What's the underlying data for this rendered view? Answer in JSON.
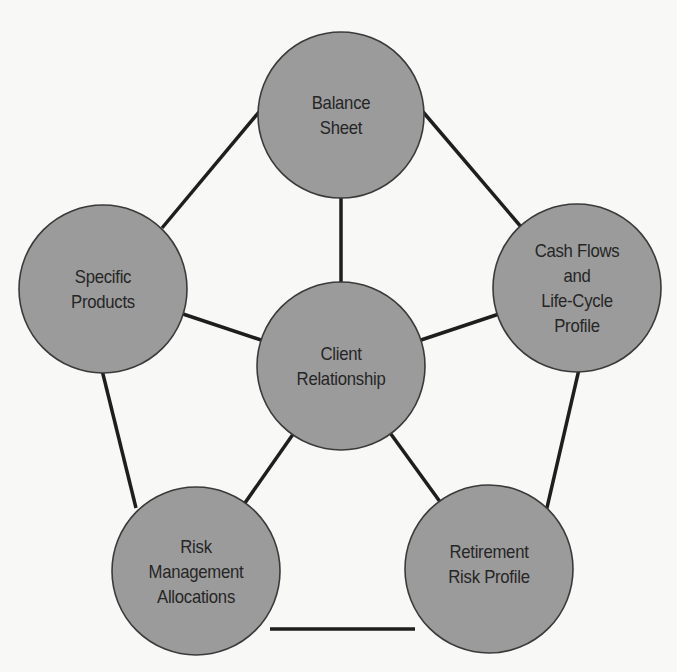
{
  "diagram": {
    "type": "hub-and-spoke network",
    "center_node": {
      "id": "client_relationship",
      "lines": [
        "Client",
        "Relationship"
      ]
    },
    "outer_nodes": [
      {
        "id": "balance_sheet",
        "lines": [
          "Balance",
          "Sheet"
        ]
      },
      {
        "id": "cash_flows",
        "lines": [
          "Cash Flows",
          "and",
          "Life-Cycle",
          "Profile"
        ]
      },
      {
        "id": "retirement_risk",
        "lines": [
          "Retirement",
          "Risk Profile"
        ]
      },
      {
        "id": "risk_management",
        "lines": [
          "Risk",
          "Management",
          "Allocations"
        ]
      },
      {
        "id": "specific_products",
        "lines": [
          "Specific",
          "Products"
        ]
      }
    ],
    "connections": [
      [
        "client_relationship",
        "balance_sheet"
      ],
      [
        "client_relationship",
        "cash_flows"
      ],
      [
        "client_relationship",
        "retirement_risk"
      ],
      [
        "client_relationship",
        "risk_management"
      ],
      [
        "client_relationship",
        "specific_products"
      ],
      [
        "balance_sheet",
        "cash_flows"
      ],
      [
        "cash_flows",
        "retirement_risk"
      ],
      [
        "retirement_risk",
        "risk_management"
      ],
      [
        "risk_management",
        "specific_products"
      ],
      [
        "specific_products",
        "balance_sheet"
      ]
    ],
    "colors": {
      "node_fill": "#9b9b9b",
      "node_stroke": "#3a3a3a",
      "edge": "#1e1e1e",
      "text": "#262626",
      "background": "#f8f8f7"
    }
  }
}
